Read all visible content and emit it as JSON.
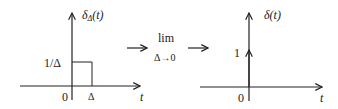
{
  "left_graph": {
    "ylabel": "δΔ(t)",
    "ylabel_main": "δ",
    "ylabel_sub": "Δ",
    "ylabel_arg": "(t)",
    "xlabel": "t",
    "height_label": "1/Δ",
    "origin_label": "0",
    "width_label": "Δ"
  },
  "operator": {
    "lim": "lim",
    "subscript": "Δ→0"
  },
  "right_graph": {
    "ylabel": "δ(t)",
    "xlabel": "t",
    "impulse_label": "1",
    "origin_label": "0"
  },
  "colors": {
    "stroke": "#222222",
    "background": "#ffffff"
  }
}
